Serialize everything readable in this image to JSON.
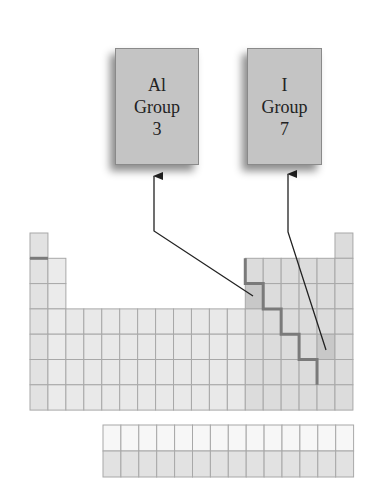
{
  "diagram": {
    "labels": [
      {
        "id": "al",
        "element": "Al",
        "group_word": "Group",
        "group_number": "3",
        "cell": {
          "col": 13,
          "row": 3
        }
      },
      {
        "id": "i",
        "element": "I",
        "group_word": "Group",
        "group_number": "7",
        "cell": {
          "col": 17,
          "row": 5
        }
      }
    ],
    "table": {
      "columns": 18,
      "rows": 7,
      "f_block_columns": 14,
      "f_block_rows": 2
    },
    "colors": {
      "s_block": "#ebebeb",
      "s_block_col1": "#e2e2e2",
      "d_block": "#e9e9e9",
      "p_block": "#dcdcdc",
      "highlight": "#c8c8c8",
      "grid_line": "#a8a8a8",
      "staircase": "#7a7a7a",
      "f_block_top": "#f7f7f7",
      "f_block_bottom": "#e2e2e2",
      "label_box": "#c4c4c4"
    }
  }
}
